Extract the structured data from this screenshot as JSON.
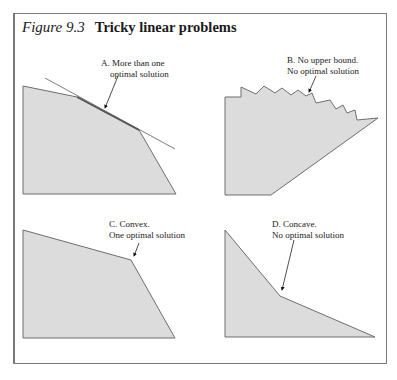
{
  "figure": {
    "number": "Figure 9.3",
    "title": "Tricky linear problems"
  },
  "panels": [
    {
      "id": "A",
      "label_line1": "A. More than one",
      "label_line2": "optimal solution"
    },
    {
      "id": "B",
      "label_line1": "B. No upper bound.",
      "label_line2": "No optimal solution"
    },
    {
      "id": "C",
      "label_line1": "C. Convex.",
      "label_line2": "One optimal solution"
    },
    {
      "id": "D",
      "label_line1": "D. Concave.",
      "label_line2": "No optimal solution"
    }
  ],
  "colors": {
    "fill": "#dcdcdc",
    "stroke": "#6e6e6e",
    "border": "#7a7a7a",
    "text": "#1a1a1a"
  }
}
